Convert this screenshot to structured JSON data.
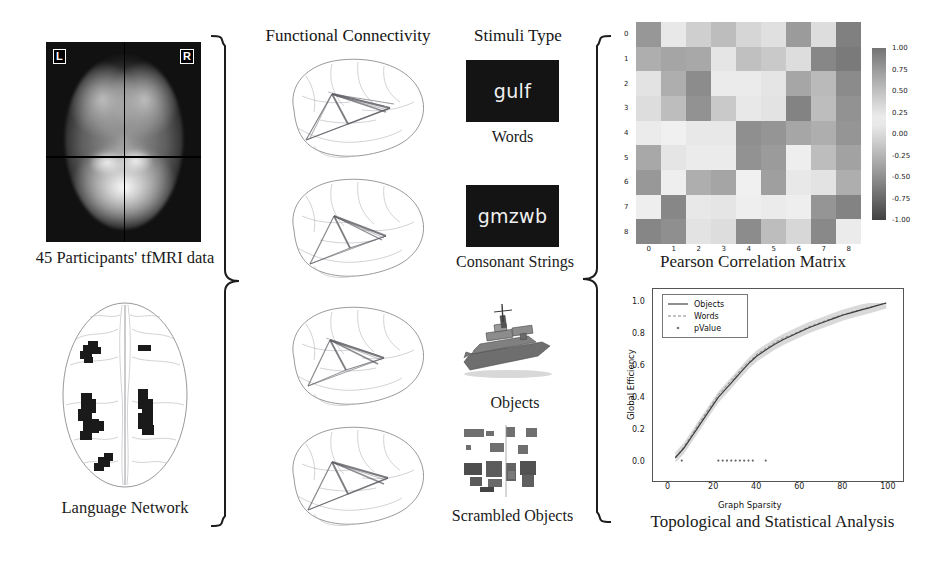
{
  "panels": {
    "fmri": {
      "caption": "45 Participants' tfMRI data",
      "left_tag": "L",
      "right_tag": "R"
    },
    "language_network": {
      "caption": "Language Network"
    },
    "connectivity": {
      "heading": "Functional Connectivity",
      "brain_count": 4
    },
    "stimuli": {
      "heading": "Stimuli Type",
      "items": [
        {
          "sample": "gulf",
          "caption": "Words"
        },
        {
          "sample": "gmzwb",
          "caption": "Consonant Strings"
        },
        {
          "sample": "",
          "caption": "Objects"
        },
        {
          "sample": "",
          "caption": "Scrambled Objects"
        }
      ]
    },
    "heatmap": {
      "caption": "Pearson Correlation Matrix"
    },
    "analysis": {
      "caption": "Topological and Statistical Analysis"
    }
  },
  "chart_data": [
    {
      "type": "heatmap",
      "title": "Pearson Correlation Matrix",
      "xlabel": "",
      "ylabel": "",
      "xticks": [
        "0",
        "1",
        "2",
        "3",
        "4",
        "5",
        "6",
        "7",
        "8"
      ],
      "yticks": [
        "0",
        "1",
        "2",
        "3",
        "4",
        "5",
        "6",
        "7",
        "8"
      ],
      "colorbar": {
        "ticks": [
          "1.00",
          "0.75",
          "0.50",
          "0.25",
          "0.00",
          "-0.25",
          "-0.50",
          "-0.75",
          "-1.00"
        ],
        "vmin": -1.0,
        "vmax": 1.0,
        "colormap": "diverging-grey"
      },
      "values": [
        [
          -0.45,
          0.22,
          0.4,
          -0.2,
          0.35,
          0.28,
          -0.42,
          0.3,
          0.92
        ],
        [
          -0.3,
          -0.36,
          -0.34,
          0.24,
          -0.18,
          -0.12,
          0.3,
          -0.55,
          0.96
        ],
        [
          0.26,
          -0.3,
          -0.52,
          0.2,
          0.12,
          0.08,
          -0.35,
          -0.22,
          0.85
        ],
        [
          0.3,
          -0.2,
          -0.48,
          -0.12,
          0.1,
          0.26,
          -0.58,
          -0.2,
          0.8
        ],
        [
          0.2,
          0.16,
          0.1,
          0.1,
          -0.5,
          -0.46,
          -0.35,
          -0.3,
          0.78
        ],
        [
          -0.34,
          0.24,
          0.12,
          0.2,
          -0.48,
          -0.42,
          0.14,
          -0.2,
          0.7
        ],
        [
          -0.44,
          0.18,
          -0.3,
          -0.36,
          0.16,
          -0.4,
          0.1,
          0.06,
          0.62
        ],
        [
          0.18,
          -0.55,
          0.22,
          0.24,
          0.14,
          0.2,
          0.18,
          -0.46,
          0.9
        ],
        [
          0.88,
          0.82,
          0.26,
          0.3,
          0.84,
          0.52,
          0.34,
          0.86,
          0.2
        ]
      ]
    },
    {
      "type": "line",
      "title": "",
      "xlabel": "Graph Sparsity",
      "ylabel": "Global Efficiency",
      "xlim": [
        0,
        105
      ],
      "ylim": [
        -0.04,
        1.05
      ],
      "xticks": [
        0,
        20,
        40,
        60,
        80,
        100
      ],
      "yticks": [
        "0.0",
        "0.2",
        "0.4",
        "0.6",
        "0.8",
        "1.0"
      ],
      "grid": false,
      "legend_position": "upper-left",
      "series": [
        {
          "name": "Objects",
          "style": "solid",
          "x": [
            2,
            4,
            6,
            8,
            10,
            12,
            14,
            16,
            18,
            20,
            22,
            24,
            26,
            28,
            30,
            32,
            34,
            36,
            38,
            40,
            44,
            48,
            52,
            56,
            60,
            64,
            68,
            72,
            76,
            80,
            84,
            88,
            92,
            96,
            100
          ],
          "values": [
            0.03,
            0.06,
            0.09,
            0.13,
            0.17,
            0.21,
            0.25,
            0.29,
            0.33,
            0.37,
            0.41,
            0.44,
            0.47,
            0.5,
            0.53,
            0.56,
            0.59,
            0.62,
            0.645,
            0.67,
            0.705,
            0.74,
            0.77,
            0.795,
            0.82,
            0.845,
            0.865,
            0.885,
            0.905,
            0.925,
            0.94,
            0.955,
            0.97,
            0.985,
            1.0
          ]
        },
        {
          "name": "Words",
          "style": "dashed",
          "x": [
            2,
            4,
            6,
            8,
            10,
            12,
            14,
            16,
            18,
            20,
            22,
            24,
            26,
            28,
            30,
            32,
            34,
            36,
            38,
            40,
            44,
            48,
            52,
            56,
            60,
            64,
            68,
            72,
            76,
            80,
            84,
            88,
            92,
            96,
            100
          ],
          "values": [
            0.035,
            0.065,
            0.1,
            0.14,
            0.18,
            0.225,
            0.265,
            0.305,
            0.345,
            0.385,
            0.425,
            0.455,
            0.485,
            0.515,
            0.545,
            0.575,
            0.605,
            0.63,
            0.655,
            0.68,
            0.715,
            0.75,
            0.78,
            0.8,
            0.825,
            0.85,
            0.87,
            0.89,
            0.91,
            0.928,
            0.943,
            0.958,
            0.972,
            0.986,
            1.0
          ]
        },
        {
          "name": "pValue",
          "style": "marker",
          "x": [
            5,
            22,
            24,
            26,
            28,
            30,
            32,
            34,
            36,
            38,
            44
          ],
          "values": [
            0.0,
            0.0,
            0.0,
            0.0,
            0.0,
            0.0,
            0.0,
            0.0,
            0.0,
            0.0,
            0.0
          ]
        }
      ]
    }
  ],
  "colors": {
    "ink": "#141414",
    "brain_outline": "#8d8d93",
    "stim_bg": "#141414",
    "stim_fg": "#f0f0f0",
    "line_objects": "#3b3b3b",
    "line_words": "#8a8a8a"
  }
}
